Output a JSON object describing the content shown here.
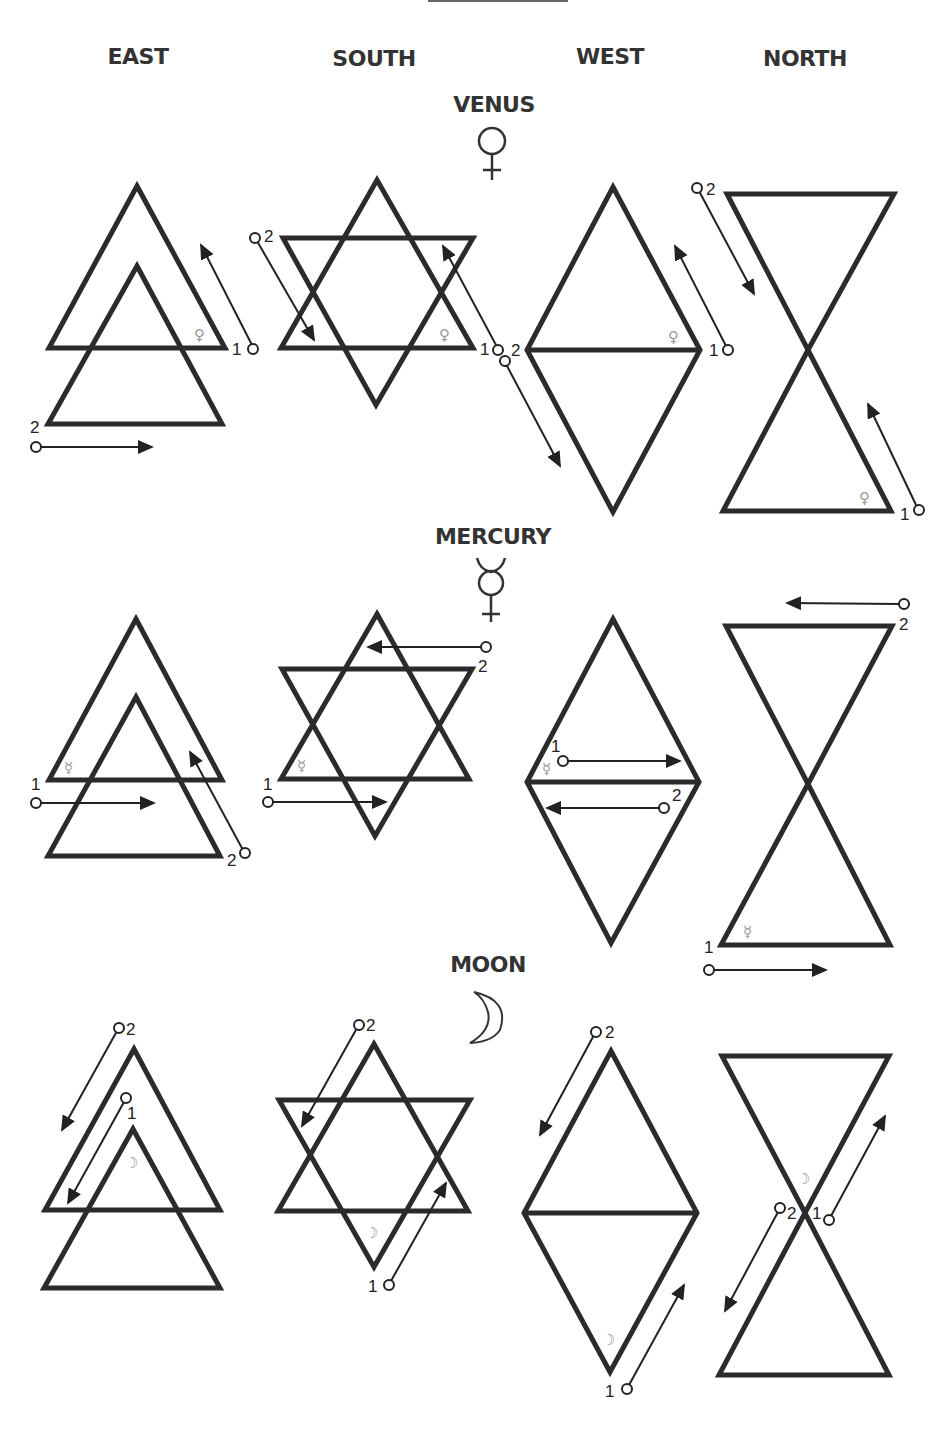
{
  "columns": [
    {
      "label": "EAST",
      "x": 138
    },
    {
      "label": "SOUTH",
      "x": 374
    },
    {
      "label": "WEST",
      "x": 610
    },
    {
      "label": "NORTH",
      "x": 805
    }
  ],
  "planets": [
    {
      "name": "VENUS",
      "symbol": "venus-symbol",
      "glyph": "♀",
      "label_x": 494,
      "label_y": 92
    },
    {
      "name": "MERCURY",
      "symbol": "mercury-symbol",
      "glyph": "☿",
      "label_x": 493,
      "label_y": 524
    },
    {
      "name": "MOON",
      "symbol": "moon-symbol",
      "glyph": "☽",
      "label_x": 488,
      "label_y": 952
    }
  ],
  "step_labels": {
    "first": "1",
    "second": "2"
  },
  "rows": [
    {
      "planet": "VENUS",
      "cells": [
        {
          "direction": "EAST",
          "shape": "two-stacked-upward-triangles",
          "start_1": "bottom-right corner, stroke up-left",
          "start_2": "bottom-left corner, stroke right"
        },
        {
          "direction": "SOUTH",
          "shape": "hexagram",
          "start_1": "bottom-right, stroke up-left",
          "start_2": "top-left, stroke down-right"
        },
        {
          "direction": "WEST",
          "shape": "diamond",
          "start_1": "right corner, stroke up-left",
          "start_2": "left corner, stroke down-right"
        },
        {
          "direction": "NORTH",
          "shape": "hourglass",
          "start_1": "bottom-right, stroke up-left",
          "start_2": "top-left, stroke down-right"
        }
      ]
    },
    {
      "planet": "MERCURY",
      "cells": [
        {
          "direction": "EAST",
          "shape": "two-stacked-upward-triangles",
          "start_1": "left, stroke right",
          "start_2": "bottom-right, stroke up-left"
        },
        {
          "direction": "SOUTH",
          "shape": "hexagram",
          "start_1": "left, stroke right",
          "start_2": "top-right, stroke left"
        },
        {
          "direction": "WEST",
          "shape": "diamond",
          "start_1": "left-center, stroke right",
          "start_2": "right-center, stroke left"
        },
        {
          "direction": "NORTH",
          "shape": "hourglass",
          "start_1": "bottom-left, stroke right",
          "start_2": "top-right, stroke left"
        }
      ]
    },
    {
      "planet": "MOON",
      "cells": [
        {
          "direction": "EAST",
          "shape": "two-stacked-upward-triangles",
          "start_1": "inner apex, stroke down-left",
          "start_2": "outer apex, stroke down-left"
        },
        {
          "direction": "SOUTH",
          "shape": "hexagram",
          "start_1": "bottom, stroke up-right",
          "start_2": "top, stroke down-left"
        },
        {
          "direction": "WEST",
          "shape": "diamond",
          "start_1": "bottom, stroke up-right",
          "start_2": "top, stroke down-left"
        },
        {
          "direction": "NORTH",
          "shape": "hourglass",
          "start_1": "center, stroke up-right",
          "start_2": "center, stroke down-left"
        }
      ]
    }
  ],
  "colors": {
    "line": "#2b2b2b",
    "text": "#333333",
    "glyph": "#999999",
    "background": "#ffffff"
  }
}
